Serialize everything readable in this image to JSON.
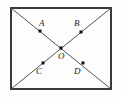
{
  "figure": {
    "kind": "geometry-diagram",
    "colors": {
      "background": "#fdfdfd",
      "rectangle_stroke": "#3a3a3a",
      "diagonal_stroke": "#555555",
      "point_fill": "#111111",
      "label_color": "#1a1a1a"
    },
    "rectangle": {
      "x": 10,
      "y": 7,
      "width": 102,
      "height": 83,
      "stroke_width": 2
    },
    "diagonals": [
      {
        "name": "diagonal-top-left-to-bottom-right",
        "x1": 11,
        "y1": 8,
        "x2": 111,
        "y2": 89
      },
      {
        "name": "diagonal-top-right-to-bottom-left",
        "x1": 111,
        "y1": 8,
        "x2": 11,
        "y2": 89
      }
    ],
    "points": [
      {
        "id": "A",
        "label": "A",
        "cx": 40,
        "cy": 31,
        "label_x": 39,
        "label_y": 19,
        "size": 3
      },
      {
        "id": "B",
        "label": "B",
        "cx": 81,
        "cy": 32,
        "label_x": 74,
        "label_y": 19,
        "size": 3
      },
      {
        "id": "O",
        "label": "O",
        "cx": 61,
        "cy": 48,
        "label_x": 58,
        "label_y": 52,
        "size": 3
      },
      {
        "id": "C",
        "label": "C",
        "cx": 43,
        "cy": 63,
        "label_x": 36,
        "label_y": 67,
        "size": 3
      },
      {
        "id": "D",
        "label": "D",
        "cx": 83,
        "cy": 63,
        "label_x": 74,
        "label_y": 67,
        "size": 3
      }
    ]
  }
}
